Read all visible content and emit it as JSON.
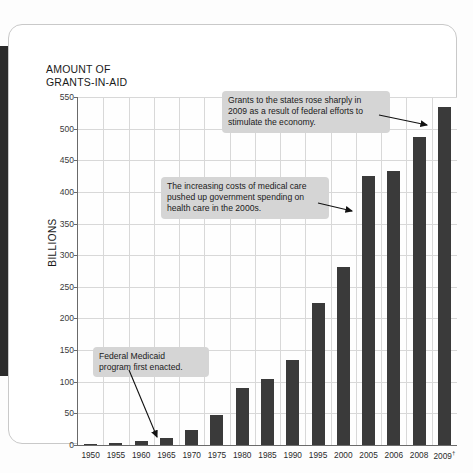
{
  "chart_data": {
    "type": "bar",
    "title": "AMOUNT OF\nGRANTS-IN-AID",
    "xlabel": "",
    "ylabel": "BILLIONS",
    "ylim": [
      0,
      550
    ],
    "ytick_step": 50,
    "grid": true,
    "legend": "none",
    "bar_color": "#3a3a3a",
    "categories": [
      "1950",
      "1955",
      "1960",
      "1965",
      "1970",
      "1975",
      "1980",
      "1985",
      "1990",
      "1995",
      "2000",
      "2005",
      "2006",
      "2008",
      "2009†"
    ],
    "values": [
      2,
      3,
      7,
      11,
      24,
      48,
      90,
      105,
      135,
      225,
      282,
      425,
      433,
      487,
      535
    ],
    "yticks": [
      "0",
      "50",
      "100",
      "150",
      "200",
      "250",
      "300",
      "350",
      "400",
      "450",
      "500",
      "550"
    ],
    "annotations": [
      {
        "id": "c1",
        "text": "Grants to the states rose sharply in\n2009 as a result of federal efforts to\nstimulate the economy.",
        "points_to": "2009†"
      },
      {
        "id": "c2",
        "text": "The increasing costs of medical care\npushed up government spending on\nhealth care in the 2000s.",
        "points_to": "2005"
      },
      {
        "id": "c3",
        "text": "Federal Medicaid\nprogram first enacted.",
        "points_to": "1965"
      }
    ]
  }
}
